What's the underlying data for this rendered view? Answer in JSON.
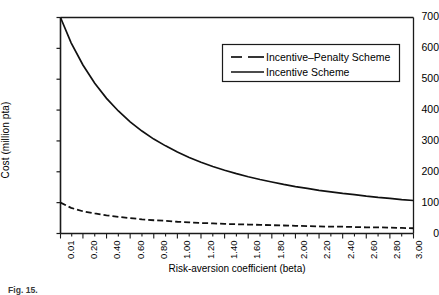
{
  "chart_data": {
    "type": "line",
    "title": "",
    "xlabel": "Risk-aversion coefficient (beta)",
    "ylabel": "Cost (million pta)",
    "xlim": [
      0.01,
      3.0
    ],
    "ylim": [
      0,
      700
    ],
    "ytick_labels": [
      "0",
      "100",
      "200",
      "300",
      "400",
      "500",
      "600",
      "700"
    ],
    "yticks": [
      0,
      100,
      200,
      300,
      400,
      500,
      600,
      700
    ],
    "xtick_labels": [
      "0.01",
      "0.20",
      "0.40",
      "0.60",
      "0.80",
      "1.00",
      "1.20",
      "1.40",
      "1.60",
      "1.80",
      "2.00",
      "2.20",
      "2.40",
      "2.60",
      "2.80",
      "3.00"
    ],
    "xticks": [
      0.01,
      0.2,
      0.4,
      0.6,
      0.8,
      1.0,
      1.2,
      1.4,
      1.6,
      1.8,
      2.0,
      2.2,
      2.4,
      2.6,
      2.8,
      3.0
    ],
    "grid": false,
    "legend_position": "upper right",
    "x": [
      0.01,
      0.1,
      0.2,
      0.3,
      0.4,
      0.5,
      0.6,
      0.7,
      0.8,
      0.9,
      1.0,
      1.1,
      1.2,
      1.3,
      1.4,
      1.5,
      1.6,
      1.7,
      1.8,
      1.9,
      2.0,
      2.1,
      2.2,
      2.3,
      2.4,
      2.5,
      2.6,
      2.7,
      2.8,
      2.9,
      3.0
    ],
    "series": [
      {
        "name": "Incentive-Penalty Scheme",
        "style": "dashed",
        "color": "#000000",
        "values": [
          100,
          83,
          72,
          65,
          59,
          54,
          50,
          46,
          43,
          41,
          38,
          36,
          34,
          33,
          31,
          30,
          29,
          28,
          27,
          26,
          25,
          24,
          23,
          22,
          22,
          21,
          20,
          20,
          19,
          18,
          17
        ]
      },
      {
        "name": "Incentive Scheme",
        "style": "solid",
        "color": "#000000",
        "values": [
          700,
          618,
          546,
          487,
          438,
          397,
          362,
          332,
          306,
          284,
          264,
          246,
          231,
          217,
          205,
          194,
          184,
          175,
          167,
          159,
          152,
          146,
          140,
          135,
          130,
          126,
          121,
          117,
          114,
          110,
          107
        ]
      }
    ]
  },
  "legend": {
    "items": [
      {
        "label": "Incentive–Penalty Scheme",
        "style": "dashed"
      },
      {
        "label": "Incentive Scheme",
        "style": "solid"
      }
    ]
  },
  "caption": {
    "prefix": "Fig. 15.",
    "text": ""
  }
}
